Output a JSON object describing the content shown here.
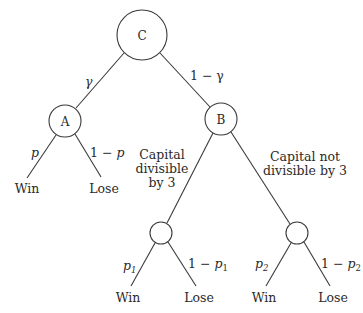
{
  "diagram": {
    "type": "probability-tree",
    "nodes": {
      "root": {
        "label": "C"
      },
      "a": {
        "label": "A"
      },
      "b": {
        "label": "B"
      },
      "b1": {
        "label": ""
      },
      "b2": {
        "label": ""
      }
    },
    "edges": {
      "c_a": {
        "prob": "γ"
      },
      "c_b": {
        "prob": "1 − γ"
      },
      "a_win": {
        "prob": "p",
        "outcome": "Win"
      },
      "a_lose": {
        "prob_prefix": "1 − ",
        "prob_var": "p",
        "outcome": "Lose"
      },
      "b_b1": {
        "condition_lines": [
          "Capital",
          "divisible",
          "by 3"
        ]
      },
      "b_b2": {
        "condition_lines": [
          "Capital not",
          "divisible by 3"
        ]
      },
      "b1_win": {
        "prob_var": "p",
        "prob_sub": "1",
        "outcome": "Win"
      },
      "b1_lose": {
        "prob_prefix": "1 − ",
        "prob_var": "p",
        "prob_sub": "1",
        "outcome": "Lose"
      },
      "b2_win": {
        "prob_var": "p",
        "prob_sub": "2",
        "outcome": "Win"
      },
      "b2_lose": {
        "prob_prefix": "1 − ",
        "prob_var": "p",
        "prob_sub": "2",
        "outcome": "Lose"
      }
    }
  }
}
